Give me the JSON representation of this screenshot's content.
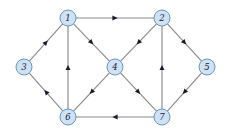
{
  "figure": {
    "background_color": "#ffffff",
    "width": 229,
    "height": 133
  },
  "style": {
    "node_fill": "#cfe2f3",
    "node_stroke": "#5b8db8",
    "node_radius": 8,
    "label_color": "#13203a",
    "edge_color": "#8a8a8a",
    "arrow_color": "#1a1a2e"
  },
  "chart_data": {
    "type": "diagram",
    "diagram_type": "directed-graph",
    "directed": true,
    "node_count": 7,
    "edge_count": 12,
    "nodes": [
      {
        "id": "1",
        "label": "1",
        "x": 68,
        "y": 18
      },
      {
        "id": "2",
        "label": "2",
        "x": 162,
        "y": 18
      },
      {
        "id": "3",
        "label": "3",
        "x": 24,
        "y": 67
      },
      {
        "id": "4",
        "label": "4",
        "x": 115,
        "y": 67
      },
      {
        "id": "5",
        "label": "5",
        "x": 207,
        "y": 67
      },
      {
        "id": "6",
        "label": "6",
        "x": 68,
        "y": 117
      },
      {
        "id": "7",
        "label": "7",
        "x": 162,
        "y": 117
      }
    ],
    "edges": [
      {
        "from": "1",
        "to": "2"
      },
      {
        "from": "1",
        "to": "4"
      },
      {
        "from": "3",
        "to": "1"
      },
      {
        "from": "6",
        "to": "1"
      },
      {
        "from": "2",
        "to": "4"
      },
      {
        "from": "2",
        "to": "5"
      },
      {
        "from": "4",
        "to": "6"
      },
      {
        "from": "4",
        "to": "7"
      },
      {
        "from": "5",
        "to": "7"
      },
      {
        "from": "6",
        "to": "3"
      },
      {
        "from": "7",
        "to": "2"
      },
      {
        "from": "7",
        "to": "6"
      }
    ]
  }
}
